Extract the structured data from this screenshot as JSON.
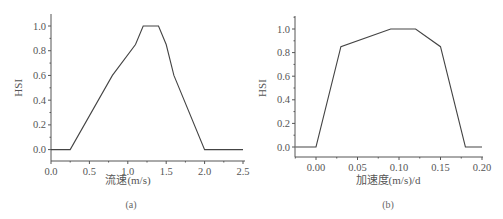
{
  "chart_data": [
    {
      "panel": "(a)",
      "type": "line",
      "title": "",
      "xlabel": "流速(m/s)",
      "ylabel": "HSI",
      "x": [
        0.0,
        0.25,
        0.8,
        1.1,
        1.2,
        1.4,
        1.5,
        1.6,
        2.0,
        2.5
      ],
      "values": [
        0.0,
        0.0,
        0.6,
        0.85,
        1.0,
        1.0,
        0.85,
        0.6,
        0.0,
        0.0
      ],
      "xlim": [
        0.0,
        2.5
      ],
      "ylim": [
        -0.1,
        1.1
      ],
      "xticks": [
        0.0,
        0.5,
        1.0,
        1.5,
        2.0,
        2.5
      ],
      "xtick_labels": [
        "0.0",
        "0.5",
        "1.0",
        "1.5",
        "2.0",
        "2.5"
      ],
      "yticks": [
        0.0,
        0.2,
        0.4,
        0.6,
        0.8,
        1.0
      ],
      "ytick_labels": [
        "0.0",
        "0.2",
        "0.4",
        "0.6",
        "0.8",
        "1.0"
      ],
      "grid": false,
      "legend": null
    },
    {
      "panel": "(b)",
      "type": "line",
      "title": "",
      "xlabel": "加速度(m/s)/d",
      "ylabel": "HSI",
      "x": [
        -0.025,
        0.0,
        0.03,
        0.09,
        0.12,
        0.15,
        0.18,
        0.2
      ],
      "values": [
        0.0,
        0.0,
        0.85,
        1.0,
        1.0,
        0.85,
        0.0,
        0.0
      ],
      "xlim": [
        -0.025,
        0.2
      ],
      "ylim": [
        -0.1,
        1.1
      ],
      "xticks": [
        0.0,
        0.05,
        0.1,
        0.15,
        0.2
      ],
      "xtick_labels": [
        "0.00",
        "0.05",
        "0.10",
        "0.15",
        "0.20"
      ],
      "yticks": [
        0.0,
        0.2,
        0.4,
        0.6,
        0.8,
        1.0
      ],
      "ytick_labels": [
        "0.0",
        "0.2",
        "0.4",
        "0.6",
        "0.8",
        "1.0"
      ],
      "grid": false,
      "legend": null
    }
  ],
  "captions": {
    "a": "(a)",
    "b": "(b)"
  }
}
